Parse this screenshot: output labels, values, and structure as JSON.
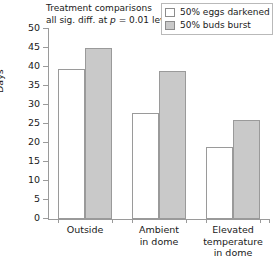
{
  "annotation": {
    "line1": "Treatment comparisons",
    "line2_pre": "all sig. diff. at ",
    "line2_italic": "p",
    "line2_post": " = 0.01 level"
  },
  "legend": {
    "items": [
      {
        "label": "50% eggs darkened",
        "swatch": "empty",
        "color": "#ffffff"
      },
      {
        "label": "50% buds burst",
        "swatch": "filled",
        "color": "#c9c9c9"
      }
    ]
  },
  "chart_data": {
    "type": "bar",
    "title": "",
    "xlabel": "",
    "ylabel": "Days",
    "ylim": [
      0,
      50
    ],
    "yticks": [
      0,
      5,
      10,
      15,
      20,
      25,
      30,
      35,
      40,
      45,
      50
    ],
    "ytick_labels": [
      "0",
      "5",
      "10",
      "15",
      "20",
      "25",
      "30",
      "35",
      "40",
      "45",
      "50"
    ],
    "grid": false,
    "legend_position": "top-right",
    "categories": [
      "Outside",
      "Ambient\nin dome",
      "Elevated\ntemperature\nin dome"
    ],
    "series": [
      {
        "name": "50% eggs darkened",
        "color": "#ffffff",
        "values": [
          39.5,
          28,
          19
        ]
      },
      {
        "name": "50% buds burst",
        "color": "#c9c9c9",
        "values": [
          45,
          39,
          26
        ]
      }
    ],
    "annotations": [
      "Treatment comparisons",
      "all sig. diff. at p = 0.01 level"
    ]
  }
}
